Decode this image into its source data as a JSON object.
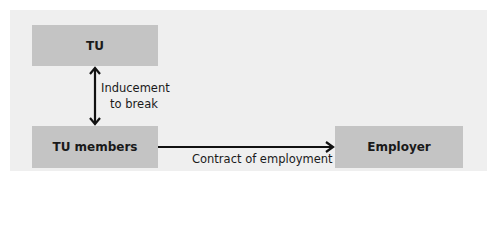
{
  "diagram": {
    "nodes": [
      {
        "id": "tu",
        "label": "TU"
      },
      {
        "id": "tu_members",
        "label": "TU members"
      },
      {
        "id": "employer",
        "label": "Employer"
      }
    ],
    "edges": [
      {
        "from": "tu",
        "to": "tu_members",
        "label_line1": "Inducement",
        "label_line2": "to break",
        "bidirectional": true
      },
      {
        "from": "tu_members",
        "to": "employer",
        "label": "Contract of employment",
        "bidirectional": false
      }
    ],
    "colors": {
      "panel_bg": "#efefef",
      "box_fill": "#c4c4c4",
      "arrow": "#111111",
      "text": "#1a1a1a"
    }
  }
}
